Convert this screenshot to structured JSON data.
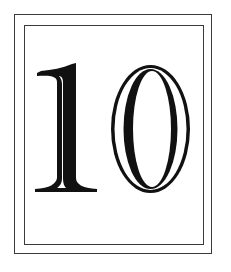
{
  "card": {
    "number": "10",
    "digits": [
      "1",
      "0"
    ],
    "ink_color": "#111111",
    "frame_color": "#3a3a3a",
    "background": "#ffffff"
  }
}
